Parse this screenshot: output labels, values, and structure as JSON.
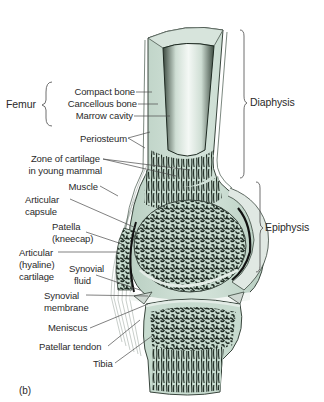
{
  "figure": {
    "panel_label": "(b)",
    "colors": {
      "bone_fill": "#c7dbcf",
      "bone_light": "#dfeae3",
      "marrow_highlight": "#f4f8f5",
      "trabeculae": "#1e2a22",
      "outline": "#3a463e",
      "cartilage": "#e3ece6",
      "muscle_lines": "#9aa39d",
      "label_text": "#2a2a2a",
      "leader_lines": "#4a4a4a"
    }
  },
  "labels": {
    "femur_group": "Femur",
    "compact_bone": "Compact bone",
    "cancellous_bone": "Cancellous bone",
    "marrow_cavity": "Marrow cavity",
    "periosteum": "Periosteum",
    "zone_of_cartilage_line1": "Zone of cartilage",
    "zone_of_cartilage_line2": "in young mammal",
    "muscle": "Muscle",
    "articular_capsule_line1": "Articular",
    "articular_capsule_line2": "capsule",
    "patella_line1": "Patella",
    "patella_line2": "(kneecap)",
    "articular_cartilage_line1": "Articular",
    "articular_cartilage_line2": "(hyaline)",
    "articular_cartilage_line3": "cartilage",
    "synovial_fluid_line1": "Synovial",
    "synovial_fluid_line2": "fluid",
    "synovial_membrane_line1": "Synovial",
    "synovial_membrane_line2": "membrane",
    "meniscus": "Meniscus",
    "patellar_tendon": "Patellar tendon",
    "tibia": "Tibia",
    "diaphysis": "Diaphysis",
    "epiphysis": "Epiphysis"
  }
}
